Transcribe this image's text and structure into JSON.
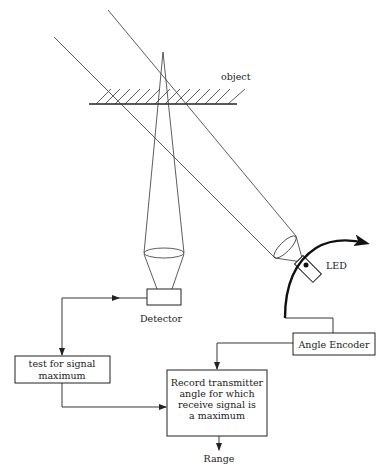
{
  "diagram": {
    "labels": {
      "object": "object",
      "led": "LED",
      "detector": "Detector",
      "angle_encoder": "Angle Encoder",
      "test_box": [
        "test for signal",
        "maximum"
      ],
      "record_box": [
        "Record transmitter",
        "angle for which",
        "receive signal is",
        "a maximum"
      ],
      "range": "Range"
    },
    "colors": {
      "line": "#222222",
      "background": "#ffffff"
    }
  }
}
